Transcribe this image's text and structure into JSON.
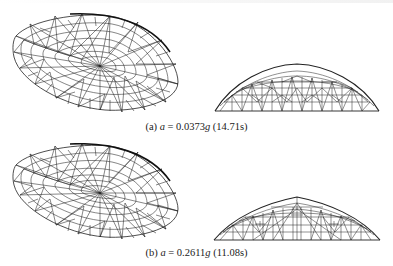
{
  "figure": {
    "panels": [
      {
        "id": "a",
        "label": "(a)",
        "var": "a",
        "equals": "=",
        "value": "0.0373",
        "unit": "g",
        "time": "(14.71s)",
        "views": [
          "oblique-view",
          "side-view"
        ]
      },
      {
        "id": "b",
        "label": "(b)",
        "var": "a",
        "equals": "=",
        "value": "0.2611",
        "unit": "g",
        "time": "(11.08s)",
        "views": [
          "oblique-view",
          "side-view"
        ]
      }
    ],
    "colors": {
      "line": "#222222",
      "background": "#ffffff"
    }
  }
}
